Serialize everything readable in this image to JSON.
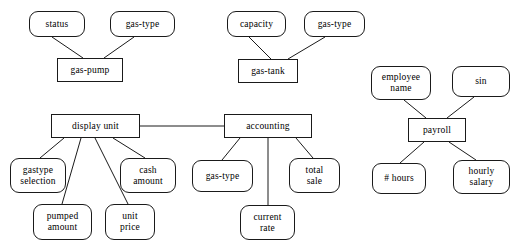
{
  "diagram": {
    "type": "entity-relationship-diagram",
    "background_color": "#ffffff",
    "line_color": "#1a1a1a",
    "text_color": "#000000",
    "groups": [
      {
        "name": "gas-pump-group",
        "entity": "gas-pump",
        "attributes": [
          "status",
          "gas-type"
        ]
      },
      {
        "name": "gas-tank-group",
        "entity": "gas-tank",
        "attributes": [
          "capacity",
          "gas-type"
        ]
      },
      {
        "name": "display-unit-group",
        "entity": "display  unit",
        "attributes": [
          "gastype\nselection",
          "pumped\namount",
          "unit\nprice",
          "cash\namount"
        ]
      },
      {
        "name": "accounting-group",
        "entity": "accounting",
        "attributes": [
          "gas-type",
          "current\nrate",
          "total\nsale"
        ]
      },
      {
        "name": "payroll-group",
        "entity": "payroll",
        "attributes": [
          "employee\nname",
          "sin",
          "# hours",
          "hourly\nsalary"
        ]
      }
    ]
  },
  "nodes": {
    "status": {
      "label": "status",
      "x": 29,
      "y": 11,
      "w": 56,
      "h": 26,
      "shape": "attribute"
    },
    "gas_type_pump": {
      "label": "gas-type",
      "x": 110,
      "y": 11,
      "w": 65,
      "h": 26,
      "shape": "attribute"
    },
    "gas_pump": {
      "label": "gas-pump",
      "x": 57,
      "y": 58,
      "w": 66,
      "h": 24,
      "shape": "entity"
    },
    "capacity": {
      "label": "capacity",
      "x": 227,
      "y": 11,
      "w": 59,
      "h": 26,
      "shape": "attribute"
    },
    "gas_type_tank": {
      "label": "gas-type",
      "x": 304,
      "y": 11,
      "w": 61,
      "h": 26,
      "shape": "attribute"
    },
    "gas_tank": {
      "label": "gas-tank",
      "x": 238,
      "y": 59,
      "w": 60,
      "h": 24,
      "shape": "entity"
    },
    "display_unit": {
      "label": "display  unit",
      "x": 51,
      "y": 114,
      "w": 89,
      "h": 24,
      "shape": "entity"
    },
    "gastype_selection": {
      "label": "gastype\nselection",
      "x": 10,
      "y": 158,
      "w": 56,
      "h": 35,
      "shape": "attribute"
    },
    "pumped_amount": {
      "label": "pumped\namount",
      "x": 33,
      "y": 204,
      "w": 59,
      "h": 36,
      "shape": "attribute"
    },
    "unit_price": {
      "label": "unit\nprice",
      "x": 105,
      "y": 204,
      "w": 50,
      "h": 36,
      "shape": "attribute"
    },
    "cash_amount": {
      "label": "cash\namount",
      "x": 120,
      "y": 158,
      "w": 56,
      "h": 35,
      "shape": "attribute"
    },
    "accounting": {
      "label": "accounting",
      "x": 224,
      "y": 114,
      "w": 88,
      "h": 24,
      "shape": "entity"
    },
    "gas_type_accounting": {
      "label": "gas-type",
      "x": 192,
      "y": 160,
      "w": 61,
      "h": 32,
      "shape": "attribute"
    },
    "current_rate": {
      "label": "current\nrate",
      "x": 240,
      "y": 205,
      "w": 55,
      "h": 35,
      "shape": "attribute"
    },
    "total_sale": {
      "label": "total\nsale",
      "x": 289,
      "y": 158,
      "w": 51,
      "h": 35,
      "shape": "attribute"
    },
    "employee_name": {
      "label": "employee\nname",
      "x": 371,
      "y": 66,
      "w": 60,
      "h": 34,
      "shape": "attribute"
    },
    "sin": {
      "label": "sin",
      "x": 452,
      "y": 66,
      "w": 58,
      "h": 31,
      "shape": "attribute"
    },
    "payroll": {
      "label": "payroll",
      "x": 408,
      "y": 118,
      "w": 58,
      "h": 24,
      "shape": "entity"
    },
    "hours": {
      "label": "# hours",
      "x": 372,
      "y": 163,
      "w": 54,
      "h": 31,
      "shape": "attribute"
    },
    "hourly_salary": {
      "label": "hourly\nsalary",
      "x": 453,
      "y": 160,
      "w": 57,
      "h": 34,
      "shape": "attribute"
    }
  },
  "edges": [
    {
      "name": "status-to-gas-pump",
      "x1": 52,
      "y1": 37,
      "x2": 83,
      "y2": 58
    },
    {
      "name": "gas-type-to-gas-pump",
      "x1": 134,
      "y1": 37,
      "x2": 104,
      "y2": 58
    },
    {
      "name": "capacity-to-gas-tank",
      "x1": 249,
      "y1": 37,
      "x2": 271,
      "y2": 59
    },
    {
      "name": "gas-type-to-gas-tank",
      "x1": 325,
      "y1": 37,
      "x2": 288,
      "y2": 59
    },
    {
      "name": "display-unit-to-accounting",
      "x1": 140,
      "y1": 126,
      "x2": 224,
      "y2": 126
    },
    {
      "name": "display-unit-to-gastype-selection",
      "x1": 64,
      "y1": 138,
      "x2": 40,
      "y2": 158
    },
    {
      "name": "display-unit-to-pumped-amount",
      "x1": 81,
      "y1": 138,
      "x2": 62,
      "y2": 204
    },
    {
      "name": "display-unit-to-unit-price",
      "x1": 95,
      "y1": 138,
      "x2": 128,
      "y2": 204
    },
    {
      "name": "display-unit-to-cash-amount",
      "x1": 113,
      "y1": 138,
      "x2": 145,
      "y2": 158
    },
    {
      "name": "accounting-to-gas-type",
      "x1": 240,
      "y1": 138,
      "x2": 222,
      "y2": 160
    },
    {
      "name": "accounting-to-current-rate",
      "x1": 268,
      "y1": 138,
      "x2": 268,
      "y2": 205
    },
    {
      "name": "accounting-to-total-sale",
      "x1": 296,
      "y1": 138,
      "x2": 313,
      "y2": 158
    },
    {
      "name": "employee-name-to-payroll",
      "x1": 404,
      "y1": 100,
      "x2": 426,
      "y2": 118
    },
    {
      "name": "sin-to-payroll",
      "x1": 474,
      "y1": 97,
      "x2": 447,
      "y2": 118
    },
    {
      "name": "payroll-to-hours",
      "x1": 424,
      "y1": 142,
      "x2": 400,
      "y2": 163
    },
    {
      "name": "payroll-to-hourly-salary",
      "x1": 449,
      "y1": 142,
      "x2": 476,
      "y2": 160
    }
  ]
}
